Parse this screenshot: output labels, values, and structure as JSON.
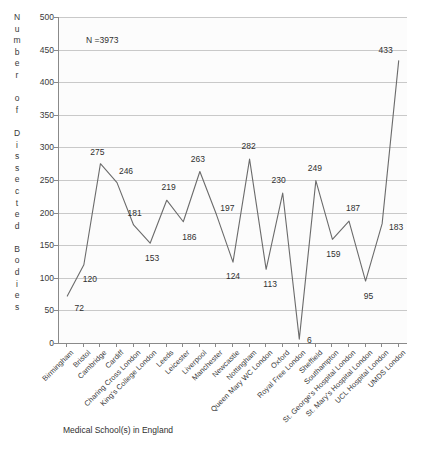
{
  "chart_data": {
    "type": "line",
    "title": "",
    "xlabel": "Medical School(s) in England",
    "ylabel": "Number of Dissected Bodies",
    "ylim": [
      0,
      500
    ],
    "ytick_step": 50,
    "yticks": [
      0,
      50,
      100,
      150,
      200,
      250,
      300,
      350,
      400,
      450,
      500
    ],
    "grid": true,
    "legend": "none",
    "annotation": "N =3973",
    "line_color": "#6b6b6b",
    "categories": [
      "Birmingham",
      "Bristol",
      "Cambridge",
      "Cardiff",
      "Charing Cross London",
      "King's College London",
      "Leeds",
      "Leicester",
      "Liverpool",
      "Manchester",
      "Newcastle",
      "Nottingham",
      "Queen Mary WC London",
      "Oxford",
      "Royal Free London",
      "Sheffield",
      "Southampton",
      "St. George's Hospital London",
      "St. Mary's Hospital London",
      "UCL Hospital London",
      "UMDS London"
    ],
    "values": [
      72,
      120,
      275,
      246,
      181,
      153,
      219,
      186,
      263,
      197,
      124,
      282,
      113,
      230,
      6,
      249,
      159,
      187,
      95,
      183,
      433
    ],
    "data_labels": [
      "72",
      "120",
      "275",
      "246",
      "181",
      "153",
      "219",
      "186",
      "263",
      "197",
      "124",
      "282",
      "113",
      "230",
      "6",
      "249",
      "159",
      "187",
      "95",
      "183",
      "433"
    ],
    "label_offsets": [
      {
        "dx": 12,
        "dy": 12
      },
      {
        "dx": 6,
        "dy": 14
      },
      {
        "dx": -3,
        "dy": -12
      },
      {
        "dx": 9,
        "dy": -12
      },
      {
        "dx": 1,
        "dy": -12
      },
      {
        "dx": 2,
        "dy": 15
      },
      {
        "dx": 2,
        "dy": -13
      },
      {
        "dx": 6,
        "dy": 15
      },
      {
        "dx": -2,
        "dy": -13
      },
      {
        "dx": 11,
        "dy": -7
      },
      {
        "dx": 0,
        "dy": 14
      },
      {
        "dx": -1,
        "dy": -13
      },
      {
        "dx": 4,
        "dy": 15
      },
      {
        "dx": -4,
        "dy": -13
      },
      {
        "dx": 10,
        "dy": 1
      },
      {
        "dx": -1,
        "dy": -13
      },
      {
        "dx": 1,
        "dy": 15
      },
      {
        "dx": 4,
        "dy": -13
      },
      {
        "dx": 3,
        "dy": 15
      },
      {
        "dx": 14,
        "dy": 3
      },
      {
        "dx": -13,
        "dy": -11
      }
    ]
  },
  "axis_titles": {
    "y_letters": [
      "N",
      "u",
      "m",
      "b",
      "e",
      "r",
      "",
      "o",
      "f",
      "",
      "D",
      "i",
      "s",
      "s",
      "e",
      "c",
      "t",
      "e",
      "d",
      "",
      "B",
      "o",
      "d",
      "i",
      "e",
      "s"
    ]
  }
}
